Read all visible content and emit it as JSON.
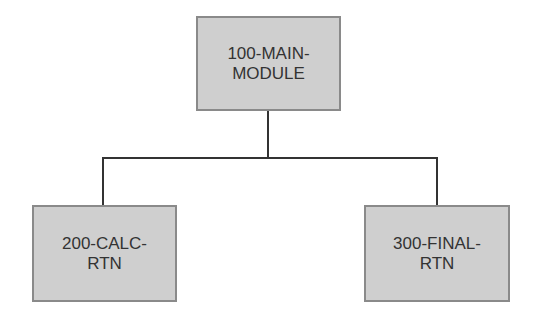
{
  "diagram": {
    "type": "hierarchy-chart",
    "root": {
      "id": "main",
      "lines": [
        "100-MAIN-",
        "MODULE"
      ]
    },
    "children": [
      {
        "id": "calc",
        "lines": [
          "200-CALC-",
          "RTN"
        ]
      },
      {
        "id": "final",
        "lines": [
          "300-FINAL-",
          "RTN"
        ]
      }
    ],
    "colors": {
      "box_fill": "#cfcfcf",
      "box_border": "#8a8a8a",
      "connector": "#333333",
      "text": "#333333",
      "background": "#ffffff"
    }
  }
}
